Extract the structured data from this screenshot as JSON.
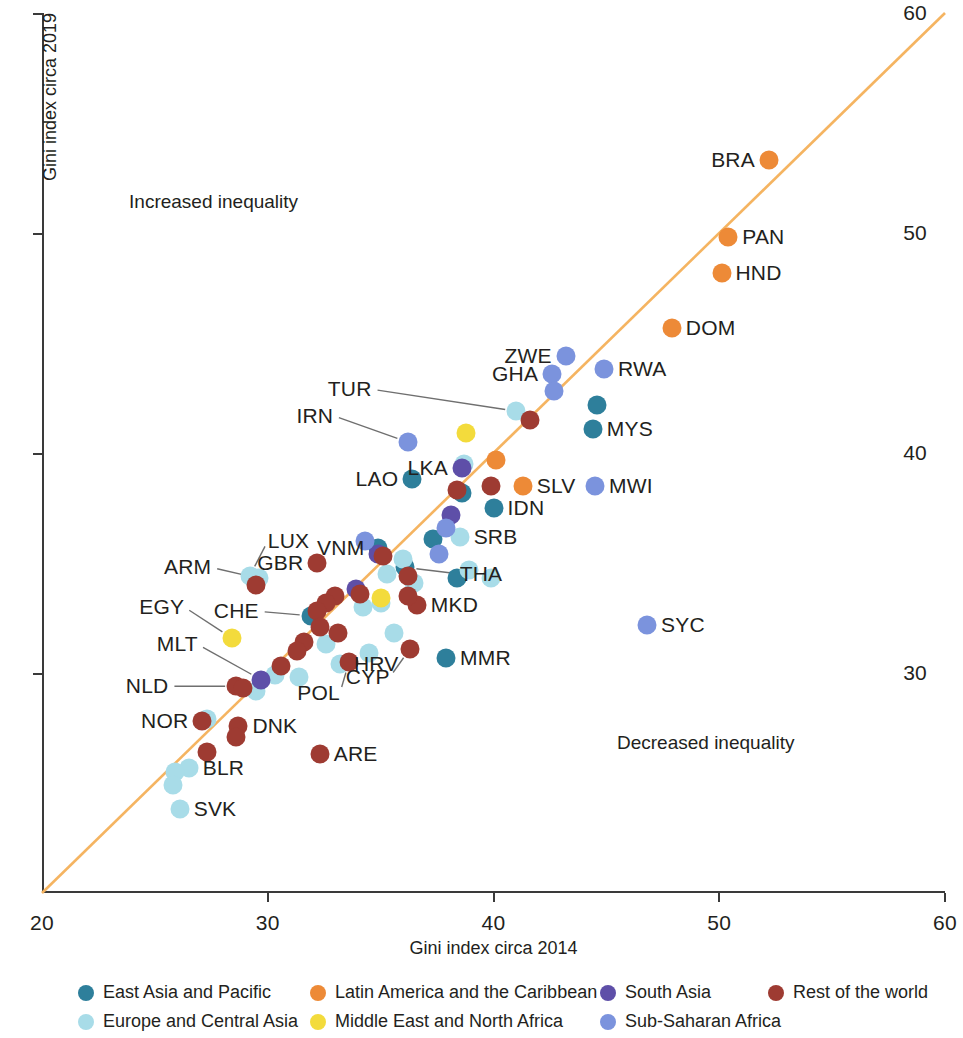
{
  "chart_data": {
    "type": "scatter",
    "title": "",
    "xlabel": "Gini index circa 2014",
    "ylabel": "Gini index circa 2019",
    "xlim": [
      20,
      60
    ],
    "ylim": [
      20,
      60
    ],
    "xticks": [
      20,
      30,
      40,
      50,
      60
    ],
    "yticks": [
      30,
      40,
      50,
      60
    ],
    "grid": false,
    "reference_line": {
      "type": "45-degree",
      "color": "#F5B461",
      "from": [
        20,
        20
      ],
      "to": [
        60,
        60
      ]
    },
    "annotations": [
      {
        "text": "Increased inequality",
        "x": 27.6,
        "y": 51.4
      },
      {
        "text": "Decreased inequality",
        "x": 49.4,
        "y": 26.8
      }
    ],
    "legend_position": "bottom",
    "series": [
      {
        "name": "East Asia and Pacific",
        "color": "#2E7F9B",
        "points": [
          {
            "code": "LAO",
            "x": 36.4,
            "y": 38.8,
            "label_pos": "left"
          },
          {
            "code": "MYS",
            "x": 44.4,
            "y": 41.1,
            "label_pos": "right"
          },
          {
            "code": "",
            "x": 44.6,
            "y": 42.2
          },
          {
            "code": "IDN",
            "x": 40.0,
            "y": 37.5,
            "label_pos": "right"
          },
          {
            "code": "",
            "x": 38.6,
            "y": 38.2
          },
          {
            "code": "",
            "x": 37.3,
            "y": 36.1
          },
          {
            "code": "THA",
            "x": 36.1,
            "y": 34.8,
            "label_pos": "right"
          },
          {
            "code": "MMR",
            "x": 37.9,
            "y": 30.7,
            "label_pos": "right"
          },
          {
            "code": "VNM",
            "x": 34.9,
            "y": 35.7,
            "label_pos": "left"
          },
          {
            "code": "CHE",
            "x": 31.9,
            "y": 32.6,
            "label_pos": "left"
          },
          {
            "code": "",
            "x": 38.4,
            "y": 34.3
          }
        ]
      },
      {
        "name": "Europe and Central Asia",
        "color": "#A8DCE8",
        "points": [
          {
            "code": "ARM",
            "x": 29.6,
            "y": 34.3,
            "label_pos": "left"
          },
          {
            "code": "TUR",
            "x": 41.0,
            "y": 41.9,
            "label_pos": "left"
          },
          {
            "code": "SRB",
            "x": 38.5,
            "y": 36.2,
            "label_pos": "right"
          },
          {
            "code": "",
            "x": 38.7,
            "y": 39.5
          },
          {
            "code": "",
            "x": 36.0,
            "y": 35.2
          },
          {
            "code": "",
            "x": 35.3,
            "y": 34.5
          },
          {
            "code": "",
            "x": 35.0,
            "y": 33.2
          },
          {
            "code": "",
            "x": 36.5,
            "y": 34.1
          },
          {
            "code": "",
            "x": 38.9,
            "y": 34.7
          },
          {
            "code": "",
            "x": 39.9,
            "y": 34.3
          },
          {
            "code": "",
            "x": 34.5,
            "y": 30.9
          },
          {
            "code": "HRV",
            "x": 33.2,
            "y": 30.4,
            "label_pos": "right"
          },
          {
            "code": "",
            "x": 32.6,
            "y": 31.3
          },
          {
            "code": "",
            "x": 31.4,
            "y": 29.8
          },
          {
            "code": "",
            "x": 30.3,
            "y": 29.9
          },
          {
            "code": "",
            "x": 29.5,
            "y": 29.2
          },
          {
            "code": "LUX",
            "x": 29.2,
            "y": 34.4,
            "label_pos": "left"
          },
          {
            "code": "",
            "x": 27.3,
            "y": 27.9
          },
          {
            "code": "BLR",
            "x": 26.5,
            "y": 25.7,
            "label_pos": "right"
          },
          {
            "code": "",
            "x": 25.9,
            "y": 25.5
          },
          {
            "code": "",
            "x": 25.8,
            "y": 24.9
          },
          {
            "code": "SVK",
            "x": 26.1,
            "y": 23.8,
            "label_pos": "right"
          },
          {
            "code": "",
            "x": 35.6,
            "y": 31.8
          },
          {
            "code": "",
            "x": 34.2,
            "y": 33.0
          }
        ]
      },
      {
        "name": "Latin America and the Caribbean",
        "color": "#ED8A37",
        "points": [
          {
            "code": "BRA",
            "x": 52.2,
            "y": 53.3,
            "label_pos": "left"
          },
          {
            "code": "PAN",
            "x": 50.4,
            "y": 49.8,
            "label_pos": "right"
          },
          {
            "code": "HND",
            "x": 50.1,
            "y": 48.2,
            "label_pos": "right"
          },
          {
            "code": "DOM",
            "x": 47.9,
            "y": 45.7,
            "label_pos": "right"
          },
          {
            "code": "SLV",
            "x": 41.3,
            "y": 38.5,
            "label_pos": "right"
          },
          {
            "code": "",
            "x": 40.1,
            "y": 39.7
          }
        ]
      },
      {
        "name": "Middle East and North Africa",
        "color": "#F3DB3C",
        "points": [
          {
            "code": "",
            "x": 38.8,
            "y": 40.9
          },
          {
            "code": "EGY",
            "x": 28.4,
            "y": 31.6,
            "label_pos": "left"
          },
          {
            "code": "",
            "x": 35.0,
            "y": 33.4
          }
        ]
      },
      {
        "name": "South Asia",
        "color": "#5E4FA8",
        "points": [
          {
            "code": "LKA",
            "x": 38.6,
            "y": 39.3,
            "label_pos": "left"
          },
          {
            "code": "",
            "x": 38.1,
            "y": 37.2
          },
          {
            "code": "",
            "x": 34.9,
            "y": 35.4
          },
          {
            "code": "",
            "x": 33.9,
            "y": 33.8
          },
          {
            "code": "MLT",
            "x": 29.7,
            "y": 29.7,
            "label_pos": "left"
          }
        ]
      },
      {
        "name": "Sub-Saharan Africa",
        "color": "#7B93DD",
        "points": [
          {
            "code": "ZWE",
            "x": 43.2,
            "y": 44.4,
            "label_pos": "left"
          },
          {
            "code": "RWA",
            "x": 44.9,
            "y": 43.8,
            "label_pos": "right"
          },
          {
            "code": "GHA",
            "x": 42.6,
            "y": 43.6,
            "label_pos": "left"
          },
          {
            "code": "",
            "x": 42.7,
            "y": 42.8
          },
          {
            "code": "IRN",
            "x": 36.2,
            "y": 40.5,
            "label_pos": "left"
          },
          {
            "code": "MWI",
            "x": 44.5,
            "y": 38.5,
            "label_pos": "right"
          },
          {
            "code": "SYC",
            "x": 46.8,
            "y": 32.2,
            "label_pos": "right"
          },
          {
            "code": "",
            "x": 37.9,
            "y": 36.6
          },
          {
            "code": "",
            "x": 34.3,
            "y": 36.0
          },
          {
            "code": "",
            "x": 37.6,
            "y": 35.4
          }
        ]
      },
      {
        "name": "Rest of the world",
        "color": "#9E3B32",
        "points": [
          {
            "code": "",
            "x": 41.6,
            "y": 41.5
          },
          {
            "code": "",
            "x": 39.9,
            "y": 38.5
          },
          {
            "code": "",
            "x": 38.4,
            "y": 38.3
          },
          {
            "code": "GBR",
            "x": 32.2,
            "y": 35.0,
            "label_pos": "left"
          },
          {
            "code": "",
            "x": 29.5,
            "y": 34.0
          },
          {
            "code": "",
            "x": 35.1,
            "y": 35.3
          },
          {
            "code": "",
            "x": 36.2,
            "y": 34.4
          },
          {
            "code": "MKD",
            "x": 36.6,
            "y": 33.1,
            "label_pos": "right"
          },
          {
            "code": "",
            "x": 36.2,
            "y": 33.5
          },
          {
            "code": "",
            "x": 34.1,
            "y": 33.6
          },
          {
            "code": "",
            "x": 33.0,
            "y": 33.5
          },
          {
            "code": "",
            "x": 32.6,
            "y": 33.2
          },
          {
            "code": "",
            "x": 32.2,
            "y": 32.8
          },
          {
            "code": "",
            "x": 32.3,
            "y": 32.1
          },
          {
            "code": "",
            "x": 33.1,
            "y": 31.8
          },
          {
            "code": "",
            "x": 31.6,
            "y": 31.4
          },
          {
            "code": "CYP",
            "x": 36.3,
            "y": 31.1,
            "label_pos": "right"
          },
          {
            "code": "POL",
            "x": 33.6,
            "y": 30.5,
            "label_pos": "right"
          },
          {
            "code": "",
            "x": 31.3,
            "y": 31.0
          },
          {
            "code": "",
            "x": 30.6,
            "y": 30.3
          },
          {
            "code": "NLD",
            "x": 28.6,
            "y": 29.4,
            "label_pos": "left"
          },
          {
            "code": "",
            "x": 28.9,
            "y": 29.3
          },
          {
            "code": "NOR",
            "x": 27.1,
            "y": 27.8,
            "label_pos": "left"
          },
          {
            "code": "DNK",
            "x": 28.7,
            "y": 27.6,
            "label_pos": "right"
          },
          {
            "code": "",
            "x": 28.6,
            "y": 27.1
          },
          {
            "code": "",
            "x": 27.3,
            "y": 26.4
          },
          {
            "code": "ARE",
            "x": 32.3,
            "y": 26.3,
            "label_pos": "right"
          }
        ]
      }
    ]
  },
  "legend": {
    "items": [
      {
        "label": "East Asia and Pacific",
        "color": "#2E7F9B"
      },
      {
        "label": "Latin America and the Caribbean",
        "color": "#ED8A37"
      },
      {
        "label": "South Asia",
        "color": "#5E4FA8"
      },
      {
        "label": "Rest of the world",
        "color": "#9E3B32"
      },
      {
        "label": "Europe and Central Asia",
        "color": "#A8DCE8"
      },
      {
        "label": "Middle East and North Africa",
        "color": "#F3DB3C"
      },
      {
        "label": "Sub-Saharan Africa",
        "color": "#7B93DD"
      }
    ]
  }
}
